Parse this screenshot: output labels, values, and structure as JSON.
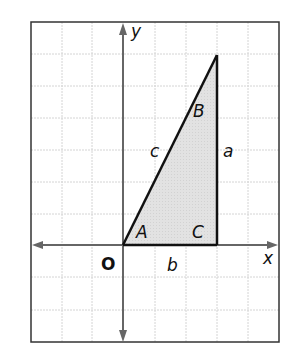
{
  "diagram": {
    "type": "right-triangle-on-coordinate-grid",
    "axes": {
      "x_label": "x",
      "y_label": "y",
      "origin_label": "O"
    },
    "vertices": {
      "A": "A",
      "B": "B",
      "C": "C"
    },
    "sides": {
      "a": "a",
      "b": "b",
      "c": "c"
    },
    "colors": {
      "grid": "#cfcfcf",
      "frame": "#333333",
      "axis": "#666666",
      "triangle_fill": "#dedede",
      "triangle_stroke": "#111111"
    }
  }
}
